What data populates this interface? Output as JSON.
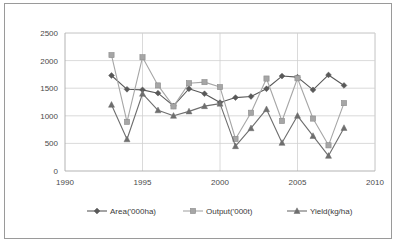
{
  "chart_data": {
    "type": "line",
    "title": "",
    "subtitle": "",
    "xlabel": "",
    "ylabel": "",
    "xlim": [
      1990,
      2010
    ],
    "ylim": [
      0,
      2500
    ],
    "x_ticks": [
      1990,
      1995,
      2000,
      2005,
      2010
    ],
    "y_ticks": [
      0,
      500,
      1000,
      1500,
      2000,
      2500
    ],
    "grid": true,
    "legend_position": "bottom",
    "x": [
      1993,
      1994,
      1995,
      1996,
      1997,
      1998,
      1999,
      2000,
      2001,
      2002,
      2003,
      2004,
      2005,
      2006,
      2007,
      2008
    ],
    "series": [
      {
        "name": "Area('000ha)",
        "marker": "diamond",
        "color": "#595959",
        "values": [
          1730,
          1480,
          1470,
          1410,
          1180,
          1490,
          1400,
          1240,
          1330,
          1350,
          1490,
          1720,
          1700,
          1470,
          1740,
          1550
        ]
      },
      {
        "name": "Output('000t)",
        "marker": "square",
        "color": "#a6a6a6",
        "values": [
          2100,
          890,
          2060,
          1550,
          1170,
          1590,
          1610,
          1520,
          580,
          1055,
          1675,
          905,
          1680,
          950,
          465,
          1230
        ]
      },
      {
        "name": "Yield(kg/ha)",
        "marker": "triangle",
        "color": "#6e6e6e",
        "values": [
          1200,
          575,
          1400,
          1100,
          1000,
          1080,
          1175,
          1220,
          450,
          775,
          1120,
          510,
          1000,
          635,
          275,
          780
        ]
      }
    ]
  },
  "legend": {
    "items": [
      {
        "label": "Area('000ha)"
      },
      {
        "label": "Output('000t)"
      },
      {
        "label": "Yield(kg/ha)"
      }
    ]
  },
  "colors": {
    "frame_border": "#9a9a9a",
    "grid": "#d0d0d0",
    "axis": "#aaaaaa",
    "text": "#4a4a4a",
    "background": "#ffffff"
  }
}
